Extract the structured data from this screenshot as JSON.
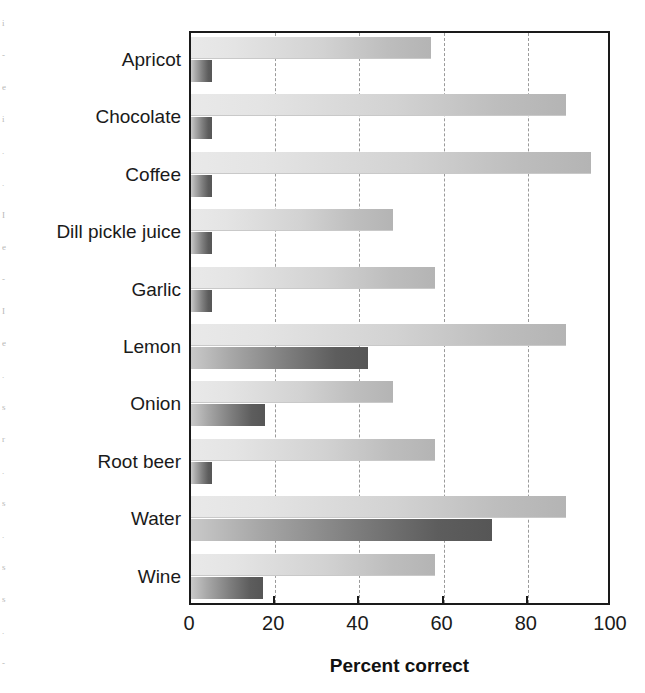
{
  "chart_data": {
    "type": "bar",
    "orientation": "horizontal",
    "title": "",
    "xlabel": "Percent correct",
    "ylabel": "",
    "xlim": [
      0,
      100
    ],
    "xticks": [
      0,
      20,
      40,
      60,
      80,
      100
    ],
    "grid": "vertical-dashed-at-20-40-60-80",
    "legend": "none",
    "categories": [
      "Apricot",
      "Chocolate",
      "Coffee",
      "Dill pickle juice",
      "Garlic",
      "Lemon",
      "Onion",
      "Root beer",
      "Water",
      "Wine"
    ],
    "series": [
      {
        "name": "light",
        "color": "#d2d2d2",
        "values": [
          57,
          89,
          95,
          48,
          58,
          89,
          48,
          58,
          89,
          58
        ]
      },
      {
        "name": "dark",
        "color": "#6e6e6e",
        "values": [
          5,
          5,
          5,
          5,
          5,
          42,
          17.5,
          5,
          71.5,
          17
        ]
      }
    ]
  },
  "axis": {
    "x_tick_labels": [
      "0",
      "20",
      "40",
      "60",
      "80",
      "100"
    ],
    "x_title": "Percent correct"
  },
  "scan_artifacts": [
    "i",
    "-",
    "e",
    "i",
    ".",
    ".",
    "I",
    "e",
    "-",
    "I",
    "e",
    ".",
    "s",
    "r",
    ".",
    "s",
    ".",
    "s",
    "s",
    ".",
    "-"
  ]
}
